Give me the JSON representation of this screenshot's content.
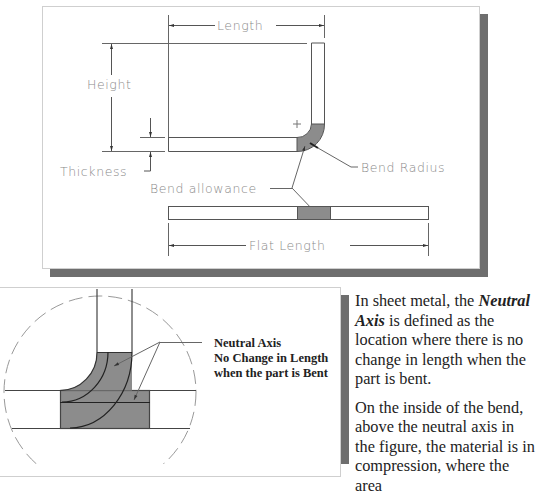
{
  "top_figure": {
    "labels": {
      "length": "Length",
      "height": "Height",
      "thickness": "Thickness",
      "bend_radius": "Bend Radius",
      "bend_allowance": "Bend allowance",
      "flat_length": "Flat Length"
    },
    "colors": {
      "fill": "#8c8c8c",
      "line": "#555555",
      "text": "#8a8a8a",
      "shadow": "#6e6e6e"
    }
  },
  "bottom_figure": {
    "annotation": {
      "line1": "Neutral Axis",
      "line2": "No Change in Length",
      "line3": "when the part is Bent"
    }
  },
  "text": {
    "para1_pre": "In sheet metal, the ",
    "para1_em": "Neutral Axis",
    "para1_post": " is defined as the location where there is no change in length when the part is bent.",
    "para2": "On the inside of the bend, above the neutral axis in the figure, the material is in compression, where the area"
  }
}
